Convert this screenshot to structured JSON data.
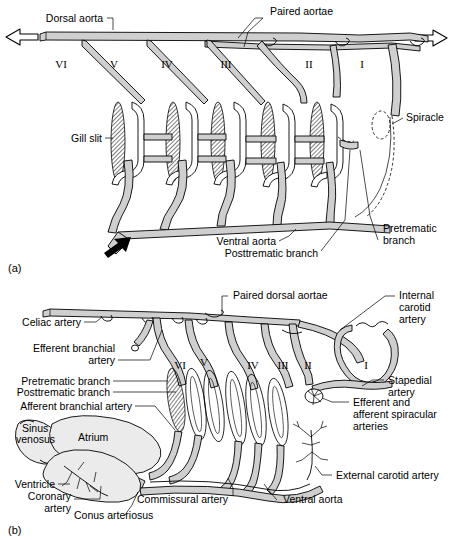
{
  "figure": {
    "panel_a": {
      "id": "(a)",
      "labels": [
        {
          "key": "dorsal_aorta",
          "text": "Dorsal aorta"
        },
        {
          "key": "paired_aortae",
          "text": "Paired aortae"
        },
        {
          "key": "gill_slit",
          "text": "Gill slit"
        },
        {
          "key": "spiracle",
          "text": "Spiracle"
        },
        {
          "key": "ventral_aorta",
          "text": "Ventral aorta"
        },
        {
          "key": "posttrematic_branch",
          "text": "Posttrematic branch"
        },
        {
          "key": "pretrematic_branch_l1",
          "text": "Pretrematic"
        },
        {
          "key": "pretrematic_branch_l2",
          "text": "branch"
        }
      ],
      "arch_numerals": [
        "VI",
        "V",
        "IV",
        "III",
        "II",
        "I"
      ]
    },
    "panel_b": {
      "id": "(b)",
      "labels": [
        {
          "key": "paired_dorsal_aortae",
          "text": "Paired dorsal aortae"
        },
        {
          "key": "internal_carotid_l1",
          "text": "Internal"
        },
        {
          "key": "internal_carotid_l2",
          "text": "carotid"
        },
        {
          "key": "internal_carotid_l3",
          "text": "artery"
        },
        {
          "key": "celiac_artery",
          "text": "Celiac artery"
        },
        {
          "key": "efferent_branchial_l1",
          "text": "Efferent branchial"
        },
        {
          "key": "efferent_branchial_l2",
          "text": "artery"
        },
        {
          "key": "stapedial_l1",
          "text": "Stapedial"
        },
        {
          "key": "stapedial_l2",
          "text": "artery"
        },
        {
          "key": "pretrematic_branch",
          "text": "Pretrematic branch"
        },
        {
          "key": "posttrematic_branch",
          "text": "Posttrematic branch"
        },
        {
          "key": "afferent_branchial_artery",
          "text": "Afferent branchial artery"
        },
        {
          "key": "spiracular_l1",
          "text": "Efferent and"
        },
        {
          "key": "spiracular_l2",
          "text": "afferent spiracular"
        },
        {
          "key": "spiracular_l3",
          "text": "arteries"
        },
        {
          "key": "sinus_venosus_l1",
          "text": "Sinus"
        },
        {
          "key": "sinus_venosus_l2",
          "text": "venosus"
        },
        {
          "key": "atrium",
          "text": "Atrium"
        },
        {
          "key": "external_carotid_artery",
          "text": "External carotid artery"
        },
        {
          "key": "ventricle",
          "text": "Ventricle"
        },
        {
          "key": "coronary_l1",
          "text": "Coronary"
        },
        {
          "key": "coronary_l2",
          "text": "artery"
        },
        {
          "key": "commissural_artery",
          "text": "Commissural artery"
        },
        {
          "key": "ventral_aorta",
          "text": "Ventral aorta"
        },
        {
          "key": "conus_arteriosus",
          "text": "Conus arteriosus"
        }
      ],
      "arch_numerals": [
        "VI",
        "V",
        "IV",
        "III",
        "II",
        "I"
      ]
    },
    "colors": {
      "background": "#ffffff",
      "vessel_fill": "#cfcfcf",
      "outline": "#000000",
      "heart_fill": "#ebebeb"
    }
  }
}
